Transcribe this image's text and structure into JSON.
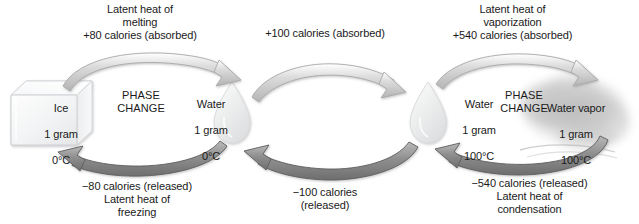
{
  "figure": {
    "background_color": "#ffffff",
    "text_color": "#1a1a1a",
    "arrow_forward_color": "#c9c9c9",
    "arrow_reverse_color": "#8a8a8a",
    "ice_color": "#f2f3f4",
    "droplet_color": "#e9eaeb",
    "vapor_color": "#bfbfbf"
  },
  "states": {
    "ice": {
      "name": "Ice",
      "mass": "1 gram",
      "temperature": "0°C",
      "icon": "ice-cube-icon"
    },
    "water_cold": {
      "name": "Water",
      "mass": "1 gram",
      "temperature": "0°C",
      "icon": "water-droplet-icon"
    },
    "water_hot": {
      "name": "Water",
      "mass": "1 gram",
      "temperature": "100°C",
      "icon": "water-droplet-icon"
    },
    "water_vapor": {
      "name": "Water vapor",
      "mass": "1 gram",
      "temperature": "100°C",
      "icon": "vapor-cloud-icon"
    }
  },
  "phase_change_labels": {
    "left": "PHASE\nCHANGE",
    "right": "PHASE\nCHANGE"
  },
  "transitions": {
    "melting": {
      "direction": "forward",
      "from": "Ice",
      "to": "Water",
      "caption": "Latent heat of\nmelting\n+80 calories (absorbed)",
      "energy": "+80 calories",
      "energy_mode": "absorbed"
    },
    "heating_water": {
      "direction": "forward",
      "from": "Water 0°C",
      "to": "Water 100°C",
      "caption": "+100 calories (absorbed)",
      "energy": "+100 calories",
      "energy_mode": "absorbed"
    },
    "vaporization": {
      "direction": "forward",
      "from": "Water",
      "to": "Water vapor",
      "caption": "Latent heat of\nvaporization\n+540 calories (absorbed)",
      "energy": "+540 calories",
      "energy_mode": "absorbed"
    },
    "freezing": {
      "direction": "reverse",
      "from": "Water",
      "to": "Ice",
      "caption": "−80 calories (released)\nLatent heat of\nfreezing",
      "energy": "−80 calories",
      "energy_mode": "released"
    },
    "cooling_water": {
      "direction": "reverse",
      "from": "Water 100°C",
      "to": "Water 0°C",
      "caption": "−100 calories\n(released)",
      "energy": "−100 calories",
      "energy_mode": "released"
    },
    "condensation": {
      "direction": "reverse",
      "from": "Water vapor",
      "to": "Water",
      "caption": "−540 calories (released)\nLatent heat of\ncondensation",
      "energy": "−540 calories",
      "energy_mode": "released"
    }
  }
}
